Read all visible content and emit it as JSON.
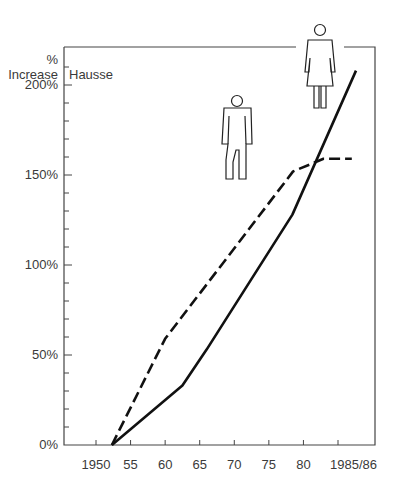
{
  "chart_data": {
    "type": "line",
    "title": "",
    "ylabel_unit": "%",
    "ylabel": "Increase",
    "ylabel_alt": "Hausse",
    "xlabel": "",
    "x_tick_labels": [
      "1950",
      "55",
      "60",
      "65",
      "70",
      "75",
      "80",
      "1985/86"
    ],
    "x_ticks": [
      1950,
      1955,
      1960,
      1965,
      1970,
      1975,
      1980,
      1985
    ],
    "y_tick_labels": [
      "0%",
      "50%",
      "100%",
      "150%",
      "200%"
    ],
    "y_ticks": [
      0,
      50,
      100,
      150,
      200
    ],
    "y_minor_step": 10,
    "xlim": [
      1943,
      1990
    ],
    "ylim": [
      0,
      222
    ],
    "grid": false,
    "legend": "pictograms: woman figure for solid line, man figure for dashed line",
    "series": [
      {
        "name": "Women",
        "style": "solid",
        "icon": "woman-figure-icon",
        "x": [
          1952.3,
          1962.5,
          1966,
          1978.4,
          1987.6
        ],
        "y": [
          0,
          33,
          53,
          128,
          208
        ]
      },
      {
        "name": "Men",
        "style": "dashed",
        "icon": "man-figure-icon",
        "x": [
          1952.3,
          1960,
          1978.5,
          1982.9,
          1987
        ],
        "y": [
          0,
          59,
          152,
          159,
          159
        ]
      }
    ]
  },
  "colors": {
    "line": "#111111",
    "axis": "#444444",
    "text": "#3a3a3a"
  }
}
